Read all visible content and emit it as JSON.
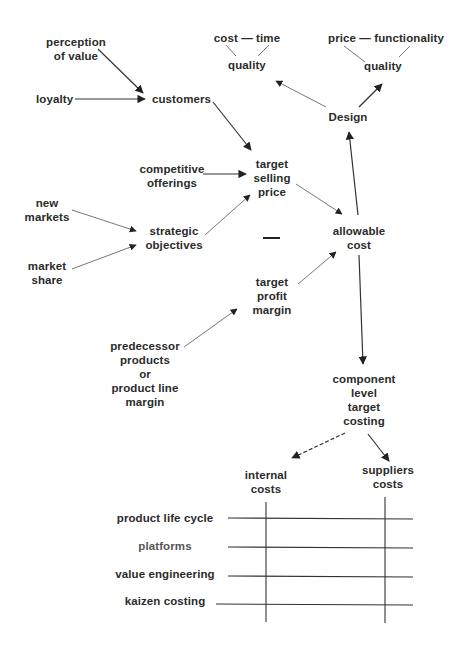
{
  "diagram": {
    "nodes": {
      "perception_of_value": {
        "lines": [
          "perception",
          "of value"
        ]
      },
      "loyalty": {
        "lines": [
          "loyalty"
        ]
      },
      "customers": {
        "lines": [
          "customers"
        ]
      },
      "competitive_offerings": {
        "lines": [
          "competitive",
          "offerings"
        ]
      },
      "new_markets": {
        "lines": [
          "new",
          "markets"
        ]
      },
      "market_share": {
        "lines": [
          "market",
          "share"
        ]
      },
      "strategic_objectives": {
        "lines": [
          "strategic",
          "objectives"
        ]
      },
      "target_selling_price": {
        "lines": [
          "target",
          "selling",
          "price"
        ]
      },
      "minus_sign": {
        "lines": [
          "—"
        ]
      },
      "target_profit_margin": {
        "lines": [
          "target",
          "profit",
          "margin"
        ]
      },
      "predecessor": {
        "lines": [
          "predecessor",
          "products",
          "or",
          "product line",
          "margin"
        ]
      },
      "allowable_cost": {
        "lines": [
          "allowable",
          "cost"
        ]
      },
      "design": {
        "lines": [
          "Design"
        ]
      },
      "triangle_left": {
        "top": "cost — time",
        "bottom": "quality"
      },
      "triangle_right": {
        "top": "price — functionality",
        "bottom": "quality"
      },
      "component_level": {
        "lines": [
          "component",
          "level",
          "target",
          "costing"
        ]
      },
      "internal_costs": {
        "lines": [
          "internal",
          "costs"
        ]
      },
      "suppliers_costs": {
        "lines": [
          "suppliers",
          "costs"
        ]
      }
    },
    "matrix": {
      "columns": [
        "internal costs",
        "suppliers costs"
      ],
      "rows": [
        "product life cycle",
        "platforms",
        "value engineering",
        "kaizen costing"
      ]
    },
    "edges": [
      {
        "from": "perception of value",
        "to": "customers"
      },
      {
        "from": "loyalty",
        "to": "customers"
      },
      {
        "from": "customers",
        "to": "target selling price"
      },
      {
        "from": "competitive offerings",
        "to": "target selling price"
      },
      {
        "from": "new markets",
        "to": "strategic objectives"
      },
      {
        "from": "market share",
        "to": "strategic objectives"
      },
      {
        "from": "strategic objectives",
        "to": "target selling price"
      },
      {
        "from": "target selling price",
        "to": "allowable cost"
      },
      {
        "from": "predecessor products or product line margin",
        "to": "target profit margin"
      },
      {
        "from": "target profit margin",
        "to": "allowable cost"
      },
      {
        "from": "allowable cost",
        "to": "Design"
      },
      {
        "from": "Design",
        "to": "quality (cost — time)"
      },
      {
        "from": "Design",
        "to": "quality (price — functionality)"
      },
      {
        "from": "allowable cost",
        "to": "component level target costing"
      },
      {
        "from": "component level target costing",
        "to": "internal costs"
      },
      {
        "from": "component level target costing",
        "to": "suppliers costs"
      }
    ]
  }
}
